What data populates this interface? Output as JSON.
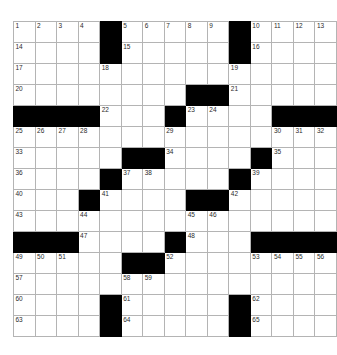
{
  "puzzle": {
    "title": "Crossword Grid",
    "rows": 16,
    "cols": 15,
    "colors": {
      "block": "#000000",
      "cell": "#ffffff",
      "grid_line": "#b4b4b4",
      "outer_border": "#9a9a9a",
      "number_text": "#2b2b2b",
      "page_background": "#ffffff"
    },
    "grid": [
      [
        {
          "type": "open",
          "number": "1"
        },
        {
          "type": "open",
          "number": "2"
        },
        {
          "type": "open",
          "number": "3"
        },
        {
          "type": "open",
          "number": "4"
        },
        {
          "type": "block",
          "number": ""
        },
        {
          "type": "open",
          "number": "5"
        },
        {
          "type": "open",
          "number": "6"
        },
        {
          "type": "open",
          "number": "7"
        },
        {
          "type": "open",
          "number": "8"
        },
        {
          "type": "open",
          "number": "9"
        },
        {
          "type": "block",
          "number": ""
        },
        {
          "type": "open",
          "number": "10"
        },
        {
          "type": "open",
          "number": "11"
        },
        {
          "type": "open",
          "number": "12"
        },
        {
          "type": "open",
          "number": "13"
        }
      ],
      [
        {
          "type": "open",
          "number": "14"
        },
        {
          "type": "open",
          "number": ""
        },
        {
          "type": "open",
          "number": ""
        },
        {
          "type": "open",
          "number": ""
        },
        {
          "type": "block",
          "number": ""
        },
        {
          "type": "open",
          "number": "15"
        },
        {
          "type": "open",
          "number": ""
        },
        {
          "type": "open",
          "number": ""
        },
        {
          "type": "open",
          "number": ""
        },
        {
          "type": "open",
          "number": ""
        },
        {
          "type": "block",
          "number": ""
        },
        {
          "type": "open",
          "number": "16"
        },
        {
          "type": "open",
          "number": ""
        },
        {
          "type": "open",
          "number": ""
        },
        {
          "type": "open",
          "number": ""
        }
      ],
      [
        {
          "type": "open",
          "number": "17"
        },
        {
          "type": "open",
          "number": ""
        },
        {
          "type": "open",
          "number": ""
        },
        {
          "type": "open",
          "number": ""
        },
        {
          "type": "open",
          "number": "18"
        },
        {
          "type": "open",
          "number": ""
        },
        {
          "type": "open",
          "number": ""
        },
        {
          "type": "open",
          "number": ""
        },
        {
          "type": "open",
          "number": ""
        },
        {
          "type": "open",
          "number": ""
        },
        {
          "type": "open",
          "number": "19"
        },
        {
          "type": "open",
          "number": ""
        },
        {
          "type": "open",
          "number": ""
        },
        {
          "type": "open",
          "number": ""
        },
        {
          "type": "open",
          "number": ""
        }
      ],
      [
        {
          "type": "open",
          "number": "20"
        },
        {
          "type": "open",
          "number": ""
        },
        {
          "type": "open",
          "number": ""
        },
        {
          "type": "open",
          "number": ""
        },
        {
          "type": "open",
          "number": ""
        },
        {
          "type": "open",
          "number": ""
        },
        {
          "type": "open",
          "number": ""
        },
        {
          "type": "open",
          "number": ""
        },
        {
          "type": "block",
          "number": ""
        },
        {
          "type": "block",
          "number": ""
        },
        {
          "type": "open",
          "number": "21"
        },
        {
          "type": "open",
          "number": ""
        },
        {
          "type": "open",
          "number": ""
        },
        {
          "type": "open",
          "number": ""
        },
        {
          "type": "open",
          "number": ""
        }
      ],
      [
        {
          "type": "block",
          "number": ""
        },
        {
          "type": "block",
          "number": ""
        },
        {
          "type": "block",
          "number": ""
        },
        {
          "type": "block",
          "number": ""
        },
        {
          "type": "open",
          "number": "22"
        },
        {
          "type": "open",
          "number": ""
        },
        {
          "type": "open",
          "number": ""
        },
        {
          "type": "block",
          "number": ""
        },
        {
          "type": "open",
          "number": "23"
        },
        {
          "type": "open",
          "number": "24"
        },
        {
          "type": "open",
          "number": ""
        },
        {
          "type": "open",
          "number": ""
        },
        {
          "type": "block",
          "number": ""
        },
        {
          "type": "block",
          "number": ""
        },
        {
          "type": "block",
          "number": ""
        }
      ],
      [
        {
          "type": "open",
          "number": "25"
        },
        {
          "type": "open",
          "number": "26"
        },
        {
          "type": "open",
          "number": "27"
        },
        {
          "type": "open",
          "number": "28"
        },
        {
          "type": "open",
          "number": ""
        },
        {
          "type": "open",
          "number": ""
        },
        {
          "type": "open",
          "number": ""
        },
        {
          "type": "open",
          "number": "29"
        },
        {
          "type": "open",
          "number": ""
        },
        {
          "type": "open",
          "number": ""
        },
        {
          "type": "open",
          "number": ""
        },
        {
          "type": "open",
          "number": ""
        },
        {
          "type": "open",
          "number": "30"
        },
        {
          "type": "open",
          "number": "31"
        },
        {
          "type": "open",
          "number": "32"
        }
      ],
      [
        {
          "type": "open",
          "number": "33"
        },
        {
          "type": "open",
          "number": ""
        },
        {
          "type": "open",
          "number": ""
        },
        {
          "type": "open",
          "number": ""
        },
        {
          "type": "open",
          "number": ""
        },
        {
          "type": "block",
          "number": ""
        },
        {
          "type": "block",
          "number": ""
        },
        {
          "type": "open",
          "number": "34"
        },
        {
          "type": "open",
          "number": ""
        },
        {
          "type": "open",
          "number": ""
        },
        {
          "type": "open",
          "number": ""
        },
        {
          "type": "block",
          "number": ""
        },
        {
          "type": "open",
          "number": "35"
        },
        {
          "type": "open",
          "number": ""
        },
        {
          "type": "open",
          "number": ""
        }
      ],
      [
        {
          "type": "open",
          "number": "36"
        },
        {
          "type": "open",
          "number": ""
        },
        {
          "type": "open",
          "number": ""
        },
        {
          "type": "open",
          "number": ""
        },
        {
          "type": "block",
          "number": ""
        },
        {
          "type": "open",
          "number": "37"
        },
        {
          "type": "open",
          "number": "38"
        },
        {
          "type": "open",
          "number": ""
        },
        {
          "type": "open",
          "number": ""
        },
        {
          "type": "open",
          "number": ""
        },
        {
          "type": "block",
          "number": ""
        },
        {
          "type": "open",
          "number": "39"
        },
        {
          "type": "open",
          "number": ""
        },
        {
          "type": "open",
          "number": ""
        },
        {
          "type": "open",
          "number": ""
        }
      ],
      [
        {
          "type": "open",
          "number": "40"
        },
        {
          "type": "open",
          "number": ""
        },
        {
          "type": "open",
          "number": ""
        },
        {
          "type": "block",
          "number": ""
        },
        {
          "type": "open",
          "number": "41"
        },
        {
          "type": "open",
          "number": ""
        },
        {
          "type": "open",
          "number": ""
        },
        {
          "type": "open",
          "number": ""
        },
        {
          "type": "block",
          "number": ""
        },
        {
          "type": "block",
          "number": ""
        },
        {
          "type": "open",
          "number": "42"
        },
        {
          "type": "open",
          "number": ""
        },
        {
          "type": "open",
          "number": ""
        },
        {
          "type": "open",
          "number": ""
        },
        {
          "type": "open",
          "number": ""
        }
      ],
      [
        {
          "type": "open",
          "number": "43"
        },
        {
          "type": "open",
          "number": ""
        },
        {
          "type": "open",
          "number": ""
        },
        {
          "type": "open",
          "number": "44"
        },
        {
          "type": "open",
          "number": ""
        },
        {
          "type": "open",
          "number": ""
        },
        {
          "type": "open",
          "number": ""
        },
        {
          "type": "open",
          "number": ""
        },
        {
          "type": "open",
          "number": "45"
        },
        {
          "type": "open",
          "number": "46"
        },
        {
          "type": "open",
          "number": ""
        },
        {
          "type": "open",
          "number": ""
        },
        {
          "type": "open",
          "number": ""
        },
        {
          "type": "open",
          "number": ""
        },
        {
          "type": "open",
          "number": ""
        }
      ],
      [
        {
          "type": "block",
          "number": ""
        },
        {
          "type": "block",
          "number": ""
        },
        {
          "type": "block",
          "number": ""
        },
        {
          "type": "open",
          "number": "47"
        },
        {
          "type": "open",
          "number": ""
        },
        {
          "type": "open",
          "number": ""
        },
        {
          "type": "open",
          "number": ""
        },
        {
          "type": "block",
          "number": ""
        },
        {
          "type": "open",
          "number": "48"
        },
        {
          "type": "open",
          "number": ""
        },
        {
          "type": "open",
          "number": ""
        },
        {
          "type": "block",
          "number": ""
        },
        {
          "type": "block",
          "number": ""
        },
        {
          "type": "block",
          "number": ""
        },
        {
          "type": "block",
          "number": ""
        }
      ],
      [
        {
          "type": "open",
          "number": "49"
        },
        {
          "type": "open",
          "number": "50"
        },
        {
          "type": "open",
          "number": "51"
        },
        {
          "type": "open",
          "number": ""
        },
        {
          "type": "open",
          "number": ""
        },
        {
          "type": "block",
          "number": ""
        },
        {
          "type": "block",
          "number": ""
        },
        {
          "type": "open",
          "number": "52"
        },
        {
          "type": "open",
          "number": ""
        },
        {
          "type": "open",
          "number": ""
        },
        {
          "type": "open",
          "number": ""
        },
        {
          "type": "open",
          "number": "53"
        },
        {
          "type": "open",
          "number": "54"
        },
        {
          "type": "open",
          "number": "55"
        },
        {
          "type": "open",
          "number": "56"
        }
      ],
      [
        {
          "type": "open",
          "number": "57"
        },
        {
          "type": "open",
          "number": ""
        },
        {
          "type": "open",
          "number": ""
        },
        {
          "type": "open",
          "number": ""
        },
        {
          "type": "open",
          "number": ""
        },
        {
          "type": "open",
          "number": "58"
        },
        {
          "type": "open",
          "number": "59"
        },
        {
          "type": "open",
          "number": ""
        },
        {
          "type": "open",
          "number": ""
        },
        {
          "type": "open",
          "number": ""
        },
        {
          "type": "open",
          "number": ""
        },
        {
          "type": "open",
          "number": ""
        },
        {
          "type": "open",
          "number": ""
        },
        {
          "type": "open",
          "number": ""
        },
        {
          "type": "open",
          "number": ""
        }
      ],
      [
        {
          "type": "open",
          "number": "60"
        },
        {
          "type": "open",
          "number": ""
        },
        {
          "type": "open",
          "number": ""
        },
        {
          "type": "open",
          "number": ""
        },
        {
          "type": "block",
          "number": ""
        },
        {
          "type": "open",
          "number": "61"
        },
        {
          "type": "open",
          "number": ""
        },
        {
          "type": "open",
          "number": ""
        },
        {
          "type": "open",
          "number": ""
        },
        {
          "type": "open",
          "number": ""
        },
        {
          "type": "block",
          "number": ""
        },
        {
          "type": "open",
          "number": "62"
        },
        {
          "type": "open",
          "number": ""
        },
        {
          "type": "open",
          "number": ""
        },
        {
          "type": "open",
          "number": ""
        }
      ],
      [
        {
          "type": "open",
          "number": "63"
        },
        {
          "type": "open",
          "number": ""
        },
        {
          "type": "open",
          "number": ""
        },
        {
          "type": "open",
          "number": ""
        },
        {
          "type": "block",
          "number": ""
        },
        {
          "type": "open",
          "number": "64"
        },
        {
          "type": "open",
          "number": ""
        },
        {
          "type": "open",
          "number": ""
        },
        {
          "type": "open",
          "number": ""
        },
        {
          "type": "open",
          "number": ""
        },
        {
          "type": "block",
          "number": ""
        },
        {
          "type": "open",
          "number": "65"
        },
        {
          "type": "open",
          "number": ""
        },
        {
          "type": "open",
          "number": ""
        },
        {
          "type": "open",
          "number": ""
        }
      ]
    ]
  }
}
